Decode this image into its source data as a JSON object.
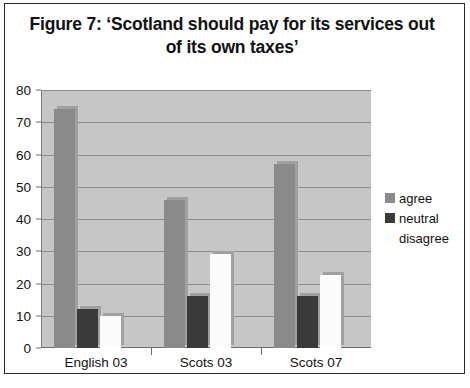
{
  "figure": {
    "title": "Figure 7: ‘Scotland should pay for its services out of its own taxes’"
  },
  "legend": {
    "position": "right",
    "items": [
      {
        "label": "agree",
        "color": "#8a8a8a",
        "name": "legend-swatch-agree"
      },
      {
        "label": "neutral",
        "color": "#3a3a3a",
        "name": "legend-swatch-neutral"
      },
      {
        "label": "disagree",
        "color": "#fbfbfb",
        "name": "legend-swatch-disagree"
      }
    ]
  },
  "axes": {
    "y_ticks": [
      "0",
      "10",
      "20",
      "30",
      "40",
      "50",
      "60",
      "70",
      "80"
    ],
    "x_ticks": [
      "English 03",
      "Scots 03",
      "Scots 07"
    ]
  },
  "colors": {
    "plot_background": "#c6c6c6",
    "gridline": "#8c8c8c",
    "frame_border": "#2a2a2a",
    "agree": "#8a8a8a",
    "neutral": "#3a3a3a",
    "disagree": "#fbfbfb"
  },
  "chart_data": {
    "type": "bar",
    "title": "Figure 7: ‘Scotland should pay for its services out of its own taxes’",
    "xlabel": "",
    "ylabel": "",
    "ylim": [
      0,
      80
    ],
    "ytick_step": 10,
    "grid": true,
    "legend_position": "right",
    "categories": [
      "English 03",
      "Scots 03",
      "Scots 07"
    ],
    "series": [
      {
        "name": "agree",
        "color": "#8a8a8a",
        "values": [
          74,
          46,
          57
        ]
      },
      {
        "name": "neutral",
        "color": "#3a3a3a",
        "values": [
          12,
          16,
          16
        ]
      },
      {
        "name": "disagree",
        "color": "#fbfbfb",
        "values": [
          10,
          29,
          22.5
        ]
      }
    ]
  }
}
